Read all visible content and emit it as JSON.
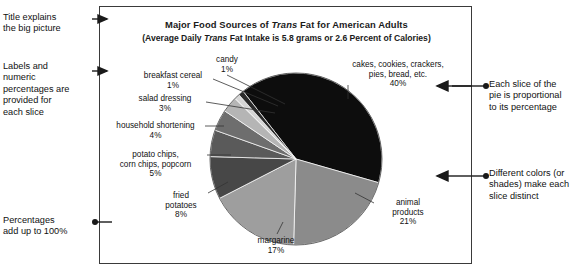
{
  "chart_data": {
    "type": "pie",
    "title": "Major Food Sources of Trans Fat for American Adults",
    "title_parts": {
      "a": "Major Food Sources of ",
      "italic": "Trans",
      "b": " Fat for American Adults"
    },
    "subtitle": "(Average Daily Trans Fat Intake is 5.8 grams or 2.6 Percent of Calories)",
    "subtitle_parts": {
      "a": "(Average Daily ",
      "italic": "Trans",
      "b": " Fat Intake is 5.8 grams or 2.6 Percent of Calories)"
    },
    "xlabel": "",
    "ylabel": "",
    "legend": "none",
    "grid": false,
    "total_percent": 100,
    "categories": [
      "cakes, cookies, crackers, pies, bread, etc.",
      "animal products",
      "margarine",
      "fried potatoes",
      "potato chips, corn chips, popcorn",
      "household shortening",
      "salad dressing",
      "breakfast cereal",
      "candy"
    ],
    "values": [
      40,
      21,
      17,
      8,
      5,
      4,
      3,
      1,
      1
    ],
    "colors": [
      "#0d0d0d",
      "#8b8b8b",
      "#9e9e9e",
      "#474747",
      "#5a5a5a",
      "#6e6e6e",
      "#b5b5b5",
      "#d6d6d6",
      "#2a2a2a"
    ],
    "slices": [
      {
        "label": "cakes, cookies, crackers,\npies, bread, etc.\n40%",
        "name": "cakes, cookies, crackers, pies, bread, etc.",
        "percent": "40%",
        "value": 40,
        "color": "#0d0d0d"
      },
      {
        "label": "animal\nproducts\n21%",
        "name": "animal products",
        "percent": "21%",
        "value": 21,
        "color": "#8b8b8b"
      },
      {
        "label": "margarine\n17%",
        "name": "margarine",
        "percent": "17%",
        "value": 17,
        "color": "#9e9e9e"
      },
      {
        "label": "fried\npotatoes\n8%",
        "name": "fried potatoes",
        "percent": "8%",
        "value": 8,
        "color": "#474747"
      },
      {
        "label": "potato chips,\ncorn chips, popcorn\n5%",
        "name": "potato chips, corn chips, popcorn",
        "percent": "5%",
        "value": 5,
        "color": "#5a5a5a"
      },
      {
        "label": "household shortening\n4%",
        "name": "household shortening",
        "percent": "4%",
        "value": 4,
        "color": "#6e6e6e"
      },
      {
        "label": "salad dressing\n3%",
        "name": "salad dressing",
        "percent": "3%",
        "value": 3,
        "color": "#b5b5b5"
      },
      {
        "label": "breakfast cereal\n1%",
        "name": "breakfast cereal",
        "percent": "1%",
        "value": 1,
        "color": "#d6d6d6"
      },
      {
        "label": "candy\n1%",
        "name": "candy",
        "percent": "1%",
        "value": 1,
        "color": "#2a2a2a"
      }
    ]
  },
  "annotations": {
    "left": [
      {
        "text": "Title explains\nthe big picture",
        "marker": "arrow"
      },
      {
        "text": "Labels and\nnumeric\npercentages are\nprovided for\neach slice",
        "marker": "arrow"
      },
      {
        "text": "Percentages\nadd up to 100%",
        "marker": "dot"
      }
    ],
    "right": [
      {
        "text": "Each slice of the\npie is proportional\nto its percentage",
        "marker": "dot"
      },
      {
        "text": "Different colors (or\nshades) make each\nslice distinct",
        "marker": "dot"
      }
    ]
  },
  "style": {
    "frame_color": "#3a3a3a",
    "background": "#ffffff",
    "text_color": "#111111"
  }
}
